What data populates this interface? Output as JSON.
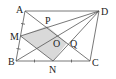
{
  "diagram": {
    "points": {
      "A": {
        "label": "A",
        "x": 25,
        "y": 11
      },
      "D": {
        "label": "D",
        "x": 99,
        "y": 11
      },
      "B": {
        "label": "B",
        "x": 16,
        "y": 61
      },
      "C": {
        "label": "C",
        "x": 90,
        "y": 61
      },
      "M": {
        "label": "M",
        "x": 20.5,
        "y": 36
      },
      "N": {
        "label": "N",
        "x": 53,
        "y": 61
      },
      "P": {
        "label": "P",
        "x": 47,
        "y": 26
      },
      "O": {
        "label": "O",
        "x": 57.5,
        "y": 36
      },
      "Q": {
        "label": "Q",
        "x": 67,
        "y": 43
      }
    },
    "segments": [
      "AD",
      "DC",
      "CB",
      "BA",
      "AC",
      "BD",
      "DM",
      "DN",
      "MN"
    ],
    "shaded_region": [
      "M",
      "P",
      "Q",
      "N"
    ],
    "shade_color": "#d9d9d9",
    "line_color": "#555555",
    "tick_marks": [
      "AM",
      "MB",
      "BN",
      "NC"
    ]
  }
}
